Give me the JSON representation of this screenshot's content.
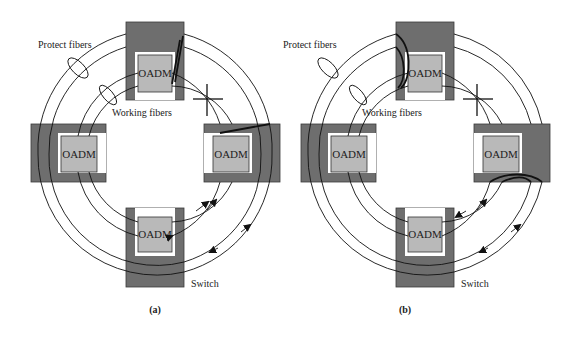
{
  "diagram": {
    "panels": [
      {
        "id": "a",
        "caption": "(a)",
        "labels": {
          "protect_fibers": "Protect fibers",
          "working_fibers": "Working fibers",
          "switch": "Switch"
        },
        "nodes": [
          {
            "position": "top",
            "label": "OADM"
          },
          {
            "position": "left",
            "label": "OADM"
          },
          {
            "position": "right",
            "label": "OADM"
          },
          {
            "position": "bottom",
            "label": "OADM"
          }
        ],
        "fault": "fiber cut between top and right nodes (working + protect)",
        "protection": "span switching at adjacent switches"
      },
      {
        "id": "b",
        "caption": "(b)",
        "labels": {
          "protect_fibers": "Protect fibers",
          "working_fibers": "Working fibers",
          "switch": "Switch"
        },
        "nodes": [
          {
            "position": "top",
            "label": "OADM"
          },
          {
            "position": "left",
            "label": "OADM"
          },
          {
            "position": "right",
            "label": "OADM"
          },
          {
            "position": "bottom",
            "label": "OADM"
          }
        ],
        "fault": "fiber cut between top and right nodes",
        "protection": "ring loopback switching"
      }
    ],
    "colors": {
      "switch_fill": "#6e6e6e",
      "oadm_fill": "#b9b9b9",
      "fiber": "#111111",
      "background": "#ffffff"
    }
  }
}
